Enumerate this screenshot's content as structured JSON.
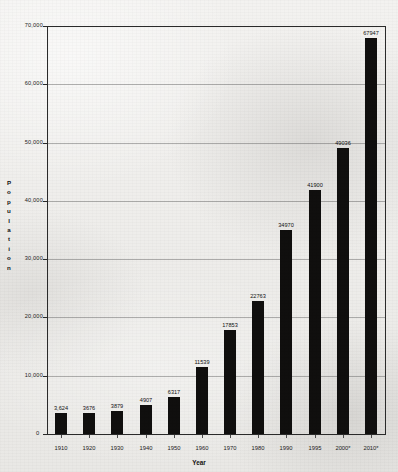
{
  "chart_data": {
    "type": "bar",
    "title": "",
    "subtitle": "",
    "xlabel": "Year",
    "ylabel": "Population",
    "categories": [
      "1910",
      "1920",
      "1930",
      "1940",
      "1950",
      "1960",
      "1970",
      "1980",
      "1990",
      "1995",
      "2000*",
      "2010*"
    ],
    "values": [
      3624,
      3676,
      3879,
      4907,
      6317,
      11539,
      17853,
      22763,
      34970,
      41900,
      49036,
      67947
    ],
    "data_labels": [
      "3,624",
      "3676",
      "3879",
      "4907",
      "6317",
      "11539",
      "17853",
      "22763",
      "34970",
      "41900",
      "49036",
      "67947"
    ],
    "ylim": [
      0,
      70000
    ],
    "ytick_values": [
      0,
      10000,
      20000,
      30000,
      40000,
      50000,
      60000,
      70000
    ],
    "ytick_labels": [
      "0",
      "10,000",
      "20,000",
      "30,000",
      "40,000",
      "50,000",
      "60,000",
      "70,000"
    ],
    "grid": true,
    "legend": null,
    "bar_color": "#100f0e",
    "note": "* denotes projected/estimated values"
  }
}
